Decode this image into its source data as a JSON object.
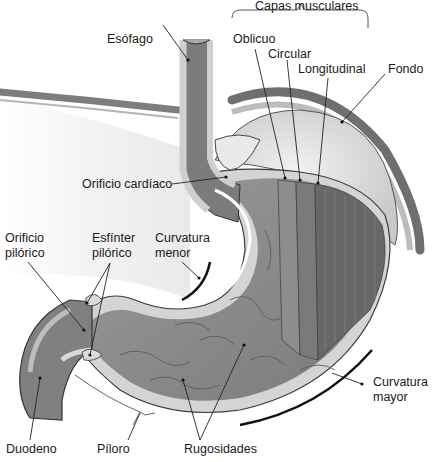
{
  "diagram": {
    "colors": {
      "background": "#ffffff",
      "mucosa": "#8a8a8a",
      "muscle_dark": "#6e6e6e",
      "wall_light": "#d6d6d6",
      "serosa": "#bdbdbd",
      "outline": "#2a2a2a",
      "lumen_fill": "#ececec"
    },
    "labels": {
      "capas_musculares": "Capas musculares",
      "oblicuo": "Oblicuo",
      "circular": "Circular",
      "longitudinal": "Longitudinal",
      "fondo": "Fondo",
      "esofago": "Esófago",
      "orificio_cardiaco": "Orificio cardíaco",
      "orificio_pilorico_1": "Orificio",
      "orificio_pilorico_2": "pilórico",
      "esfinter_pilorico_1": "Esfínter",
      "esfinter_pilorico_2": "pilórico",
      "curvatura_menor_1": "Curvatura",
      "curvatura_menor_2": "menor",
      "curvatura_mayor_1": "Curvatura",
      "curvatura_mayor_2": "mayor",
      "duodeno": "Duodeno",
      "piloro": "Píloro",
      "rugosidades": "Rugosidades"
    }
  }
}
